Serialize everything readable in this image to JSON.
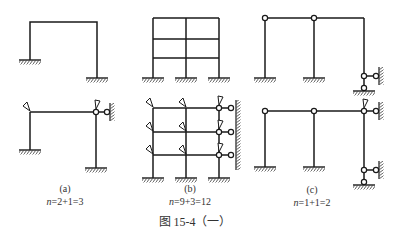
{
  "panels": [
    {
      "id": "a",
      "label": "(a)",
      "equation": "n=2+1=3",
      "equation_var": "n",
      "equation_rest": "=2+1=3"
    },
    {
      "id": "b",
      "label": "(b)",
      "equation": "n=9+3=12",
      "equation_var": "n",
      "equation_rest": "=9+3=12"
    },
    {
      "id": "c",
      "label": "(c)",
      "equation": "n=1+1=2",
      "equation_var": "n",
      "equation_rest": "=1+1=2"
    }
  ],
  "figure": {
    "title": "图 15-4（一）"
  },
  "colors": {
    "line": "#1a1a1a",
    "hatch": "#333333",
    "text": "#333333",
    "background": "#ffffff"
  }
}
